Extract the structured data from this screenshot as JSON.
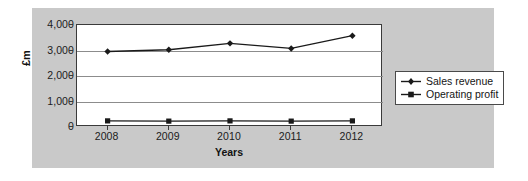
{
  "chart_data": {
    "type": "line",
    "title": "",
    "xlabel": "Years",
    "ylabel": "£m",
    "categories": [
      "2008",
      "2009",
      "2010",
      "2011",
      "2012"
    ],
    "x": [
      2008,
      2009,
      2010,
      2011,
      2012
    ],
    "ylim": [
      0,
      4000
    ],
    "yticks": [
      0,
      1000,
      2000,
      3000,
      4000
    ],
    "ytick_labels": [
      "0",
      "1,000",
      "2,000",
      "3,000",
      "4,000"
    ],
    "grid": true,
    "grid_axis": "y",
    "legend_position": "right",
    "series": [
      {
        "name": "Sales revenue",
        "marker": "diamond",
        "color": "#1a1a1a",
        "values": [
          2960,
          3030,
          3280,
          3080,
          3580
        ]
      },
      {
        "name": "Operating profit",
        "marker": "square",
        "color": "#1a1a1a",
        "values": [
          240,
          230,
          240,
          230,
          240
        ]
      }
    ]
  },
  "legend": {
    "entries": [
      {
        "label": "Sales revenue",
        "marker": "diamond"
      },
      {
        "label": "Operating profit",
        "marker": "square"
      }
    ]
  },
  "colors": {
    "panel_background": "#c9c9c9",
    "plot_background": "#ffffff",
    "axis": "#3a3a3a",
    "gridline": "#8c8c8c",
    "series": "#1a1a1a",
    "text": "#1b1b1b"
  }
}
